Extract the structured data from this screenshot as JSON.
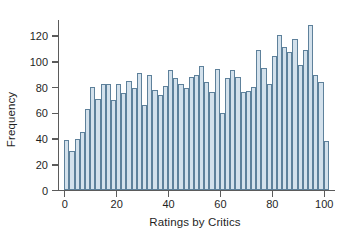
{
  "chart_data": {
    "type": "bar",
    "title": "",
    "subtitle": "",
    "xlabel": "Ratings by Critics",
    "ylabel": "Frequency",
    "xlim": [
      -2,
      104
    ],
    "ylim": [
      0,
      132
    ],
    "xticks": [
      0,
      20,
      40,
      60,
      80,
      100
    ],
    "yticks": [
      0,
      20,
      40,
      60,
      80,
      100,
      120
    ],
    "grid": false,
    "legend": null,
    "bin_width": 2,
    "bar_fill_color": "#d3e1ec",
    "bar_edge_color": "#5e819b",
    "axis_color": "#5b5b5b",
    "categories": [
      1,
      3,
      5,
      7,
      9,
      11,
      13,
      15,
      17,
      19,
      21,
      23,
      25,
      27,
      29,
      31,
      33,
      35,
      37,
      39,
      41,
      43,
      45,
      47,
      49,
      51,
      53,
      55,
      57,
      59,
      61,
      63,
      65,
      67,
      69,
      71,
      73,
      75,
      77,
      79,
      81,
      83,
      85,
      87,
      89,
      91,
      93,
      95,
      97,
      99,
      101
    ],
    "values": [
      39,
      30,
      40,
      45,
      63,
      80,
      71,
      82,
      82,
      70,
      82,
      75,
      85,
      79,
      91,
      66,
      89,
      78,
      74,
      81,
      93,
      87,
      82,
      79,
      88,
      89,
      96,
      84,
      76,
      94,
      60,
      87,
      93,
      88,
      76,
      77,
      80,
      109,
      95,
      82,
      104,
      120,
      111,
      107,
      117,
      97,
      109,
      128,
      89,
      84,
      38
    ],
    "series": [
      {
        "name": "Frequency",
        "values": [
          39,
          30,
          40,
          45,
          63,
          80,
          71,
          82,
          82,
          70,
          82,
          75,
          85,
          79,
          91,
          66,
          89,
          78,
          74,
          81,
          93,
          87,
          82,
          79,
          88,
          89,
          96,
          84,
          76,
          94,
          60,
          87,
          93,
          88,
          76,
          77,
          80,
          109,
          95,
          82,
          104,
          120,
          111,
          107,
          117,
          97,
          109,
          128,
          89,
          84,
          38
        ]
      }
    ]
  }
}
